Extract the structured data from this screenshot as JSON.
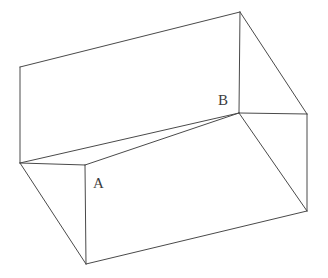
{
  "figure": {
    "kind": "open-rectangular-box-line-drawing",
    "background_color": "#ffffff",
    "stroke_color": "#4a4a4a",
    "stroke_width": 1,
    "label_color": "#3c3c3c",
    "labels": [
      {
        "id": "A",
        "text": "A",
        "x": 93,
        "y": 188
      },
      {
        "id": "B",
        "text": "B",
        "x": 218,
        "y": 105
      }
    ],
    "vertices": {
      "back_left_top": {
        "x": 20,
        "y": 67
      },
      "back_apex_top": {
        "x": 240,
        "y": 12
      },
      "right_top": {
        "x": 307,
        "y": 114
      },
      "left_mid": {
        "x": 20,
        "y": 163
      },
      "inner_front_A": {
        "x": 85,
        "y": 165
      },
      "inner_back_B": {
        "x": 239,
        "y": 113
      },
      "bottom_front": {
        "x": 86,
        "y": 264
      },
      "bottom_right": {
        "x": 307,
        "y": 211
      }
    },
    "edges": [
      {
        "name": "top-back-left-edge",
        "from": "20,67",
        "to": "240,12"
      },
      {
        "name": "top-right-edge",
        "from": "240,12",
        "to": "307,114"
      },
      {
        "name": "back-wall-left-vertical",
        "from": "20,67",
        "to": "20,163"
      },
      {
        "name": "back-wall-right-vertical",
        "from": "240,12",
        "to": "239,113"
      },
      {
        "name": "inner-floor-back-edge",
        "from": "20,163",
        "to": "239,113"
      },
      {
        "name": "inner-floor-left-edge",
        "from": "20,163",
        "to": "85,165"
      },
      {
        "name": "inner-floor-front-edge",
        "from": "85,165",
        "to": "239,113"
      },
      {
        "name": "rim-right-edge",
        "from": "239,113",
        "to": "307,114"
      },
      {
        "name": "front-face-left-vertical",
        "from": "85,165",
        "to": "86,264"
      },
      {
        "name": "front-face-bottom-edge",
        "from": "86,264",
        "to": "307,211"
      },
      {
        "name": "right-face-vertical",
        "from": "307,114",
        "to": "307,211"
      },
      {
        "name": "hidden-diagonal-left",
        "from": "20,163",
        "to": "86,264"
      },
      {
        "name": "hidden-diagonal-right",
        "from": "239,113",
        "to": "307,211"
      }
    ]
  }
}
